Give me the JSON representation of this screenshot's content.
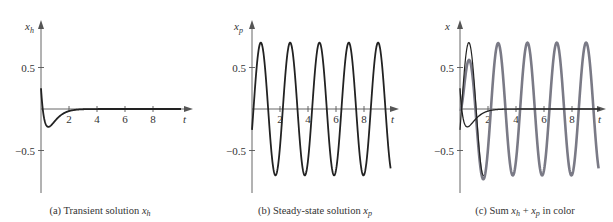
{
  "colors": {
    "black_curve": "#222222",
    "color_curve": "#7a7a86",
    "axis": "#555555"
  },
  "chart_data": [
    {
      "type": "line",
      "panel": "a",
      "caption": "(a) Transient solution x_h",
      "caption_prefix": "(a) Transient solution ",
      "caption_var": "x",
      "caption_sub": "h",
      "ylabel": "x_h",
      "ylabel_var": "x",
      "ylabel_sub": "h",
      "xlabel": "t",
      "xlim": [
        0,
        10
      ],
      "ylim": [
        -0.95,
        1.0
      ],
      "xticks": [
        2,
        4,
        6,
        8
      ],
      "yticks": [
        0.5,
        -0.5
      ],
      "ytick_labels": [
        "0.5",
        "−0.5"
      ],
      "grid": false,
      "series": [
        {
          "name": "x_h",
          "color": "black",
          "formula": "(0.25 - 2t) e^{-2.5t}",
          "x": [
            0,
            0.25,
            0.5,
            0.75,
            1.0,
            1.5,
            2.0,
            2.5,
            3,
            4,
            6,
            8,
            10
          ],
          "values": [
            0.25,
            -0.13,
            -0.21,
            -0.19,
            -0.14,
            -0.065,
            -0.025,
            -0.009,
            -0.003,
            0,
            0,
            0,
            0
          ]
        }
      ]
    },
    {
      "type": "line",
      "panel": "b",
      "caption": "(b) Steady-state solution x_p",
      "caption_prefix": "(b) Steady-state solution ",
      "caption_var": "x",
      "caption_sub": "p",
      "ylabel": "x_p",
      "ylabel_var": "x",
      "ylabel_sub": "p",
      "xlabel": "t",
      "xlim": [
        0,
        10
      ],
      "ylim": [
        -0.95,
        1.0
      ],
      "xticks": [
        2,
        4,
        6,
        8
      ],
      "yticks": [
        0.5,
        -0.5
      ],
      "ytick_labels": [
        "0.5",
        "−0.5"
      ],
      "grid": false,
      "series": [
        {
          "name": "x_p",
          "color": "black",
          "formula": "0.8 sin(3t - 0.32)",
          "amplitude": 0.8,
          "period": 2.09,
          "x": [
            0,
            0.6,
            1.15,
            1.65,
            2.15,
            2.7,
            3.75,
            4.8,
            5.85,
            6.9,
            7.95,
            9.0
          ],
          "values": [
            -0.25,
            0.8,
            0.0,
            -0.8,
            0.0,
            0.8,
            -0.8,
            0.8,
            -0.8,
            0.8,
            -0.8,
            0.8
          ]
        }
      ]
    },
    {
      "type": "line",
      "panel": "c",
      "caption": "(c) Sum x_h + x_p in color",
      "caption_prefix": "(c) Sum ",
      "caption_var1": "x",
      "caption_sub1": "h",
      "caption_plus": " + ",
      "caption_var2": "x",
      "caption_sub2": "p",
      "caption_suffix": " in color",
      "ylabel": "x",
      "xlabel": "t",
      "xlim": [
        0,
        10
      ],
      "ylim": [
        -0.95,
        1.0
      ],
      "xticks": [
        2,
        4,
        6,
        8
      ],
      "yticks": [
        0.5,
        -0.5
      ],
      "ytick_labels": [
        "0.5",
        "−0.5"
      ],
      "grid": false,
      "series": [
        {
          "name": "x_h",
          "color": "black"
        },
        {
          "name": "x_p",
          "color": "black"
        },
        {
          "name": "x_h + x_p",
          "color": "color",
          "x": [
            0,
            0.6,
            1.6,
            2.7,
            3.75,
            4.8,
            5.85,
            6.9,
            7.95,
            9.0
          ],
          "values": [
            0.0,
            0.58,
            -0.85,
            0.8,
            -0.8,
            0.8,
            -0.8,
            0.8,
            -0.8,
            0.8
          ]
        }
      ]
    }
  ]
}
